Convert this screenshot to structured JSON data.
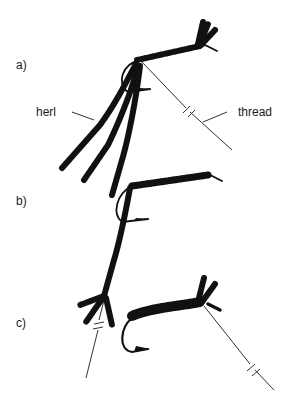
{
  "figure": {
    "panels": [
      {
        "id": "a",
        "label": "a)"
      },
      {
        "id": "b",
        "label": "b)"
      },
      {
        "id": "c",
        "label": "c)"
      }
    ],
    "callouts": {
      "herl": "herl",
      "thread": "thread"
    }
  }
}
